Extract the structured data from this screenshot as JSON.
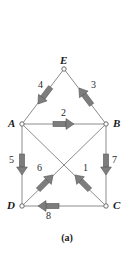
{
  "figure": {
    "caption": "(a)",
    "type": "directed-graph-diagram",
    "colors": {
      "edge_line": "#8c8c8c",
      "arrow_fill": "#7d7d7d",
      "arrow_stroke": "#5a5a5a",
      "node_stroke": "#6b6b6b",
      "node_fill": "#ffffff",
      "text": "#1a1a1a",
      "background": "#ffffff"
    },
    "nodes": [
      {
        "id": "E",
        "label": "E",
        "x": 64,
        "y": 69,
        "label_x": 60,
        "label_y": 55
      },
      {
        "id": "A",
        "label": "A",
        "x": 22,
        "y": 124,
        "label_x": 8,
        "label_y": 118
      },
      {
        "id": "B",
        "label": "B",
        "x": 106,
        "y": 124,
        "label_x": 113,
        "label_y": 118
      },
      {
        "id": "D",
        "label": "D",
        "x": 22,
        "y": 206,
        "label_x": 7,
        "label_y": 200
      },
      {
        "id": "C",
        "label": "C",
        "x": 106,
        "y": 206,
        "label_x": 113,
        "label_y": 200
      }
    ],
    "edges": [
      {
        "id": "e1",
        "label": "1",
        "from": "C",
        "to": "A",
        "line": {
          "x1": 106,
          "y1": 206,
          "x2": 22,
          "y2": 124
        },
        "arrow": {
          "cx": 82,
          "cy": 182,
          "angle": -135
        },
        "label_x": 83,
        "label_y": 163
      },
      {
        "id": "e2",
        "label": "2",
        "from": "A",
        "to": "B",
        "line": {
          "x1": 22,
          "y1": 124,
          "x2": 106,
          "y2": 124
        },
        "arrow": {
          "cx": 64,
          "cy": 124,
          "angle": 0
        },
        "label_x": 61,
        "label_y": 108
      },
      {
        "id": "e3",
        "label": "3",
        "from": "B",
        "to": "E",
        "line": {
          "x1": 106,
          "y1": 124,
          "x2": 64,
          "y2": 69
        },
        "arrow": {
          "cx": 85,
          "cy": 96,
          "angle": -127
        },
        "label_x": 91,
        "label_y": 80
      },
      {
        "id": "e4",
        "label": "4",
        "from": "E",
        "to": "A",
        "line": {
          "x1": 64,
          "y1": 69,
          "x2": 22,
          "y2": 124
        },
        "arrow": {
          "cx": 44,
          "cy": 96,
          "angle": 127
        },
        "label_x": 38,
        "label_y": 80
      },
      {
        "id": "e5",
        "label": "5",
        "from": "A",
        "to": "D",
        "line": {
          "x1": 22,
          "y1": 124,
          "x2": 22,
          "y2": 206
        },
        "arrow": {
          "cx": 22,
          "cy": 165,
          "angle": 90
        },
        "label_x": 9,
        "label_y": 155
      },
      {
        "id": "e6",
        "label": "6",
        "from": "D",
        "to": "B",
        "line": {
          "x1": 22,
          "y1": 206,
          "x2": 106,
          "y2": 124
        },
        "arrow": {
          "cx": 46,
          "cy": 182,
          "angle": -45
        },
        "label_x": 37,
        "label_y": 163
      },
      {
        "id": "e7",
        "label": "7",
        "from": "B",
        "to": "C",
        "line": {
          "x1": 106,
          "y1": 124,
          "x2": 106,
          "y2": 206
        },
        "arrow": {
          "cx": 106,
          "cy": 165,
          "angle": 90
        },
        "label_x": 112,
        "label_y": 155
      },
      {
        "id": "e8",
        "label": "8",
        "from": "C",
        "to": "D",
        "line": {
          "x1": 106,
          "y1": 206,
          "x2": 22,
          "y2": 206
        },
        "arrow": {
          "cx": 48,
          "cy": 206,
          "angle": 180
        },
        "label_x": 46,
        "label_y": 211
      }
    ]
  }
}
